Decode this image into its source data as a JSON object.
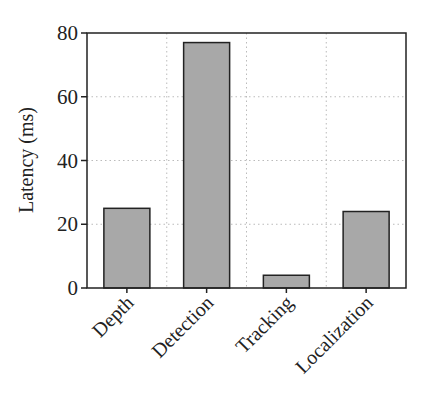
{
  "chart_data": {
    "type": "bar",
    "title": "",
    "xlabel": "",
    "ylabel": "Latency (ms)",
    "categories": [
      "Depth",
      "Detection",
      "Tracking",
      "Localization"
    ],
    "values": [
      25,
      77,
      4,
      24
    ],
    "ylim": [
      0,
      80
    ],
    "yticks": [
      0,
      20,
      40,
      60,
      80
    ],
    "grid": true,
    "grid_style": "dotted",
    "bar_color": "#a8a8a8",
    "edge_color": "#222222",
    "legend": null
  }
}
